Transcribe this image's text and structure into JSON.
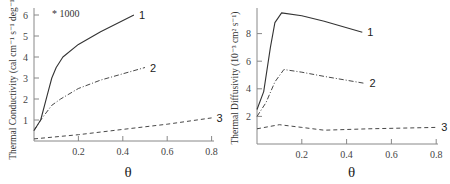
{
  "chart_data": [
    {
      "type": "line",
      "title": "",
      "xlabel": "θ",
      "ylabel": "Thermal Conductivity (cal cm⁻¹ s⁻¹ deg⁻¹)",
      "annotation": "* 1000",
      "xlim": [
        0,
        0.8
      ],
      "ylim": [
        0,
        6
      ],
      "xticks": [
        "0.2",
        "0.4",
        "0.6",
        "0.8"
      ],
      "yticks": [
        "1",
        "2",
        "3",
        "4",
        "5",
        "6"
      ],
      "grid": false,
      "series": [
        {
          "name": "1",
          "style": "solid",
          "x": [
            0,
            0.03,
            0.06,
            0.08,
            0.1,
            0.13,
            0.2,
            0.3,
            0.45
          ],
          "values": [
            0.5,
            1.0,
            2.2,
            3.0,
            3.5,
            4.0,
            4.6,
            5.2,
            6.0
          ]
        },
        {
          "name": "2",
          "style": "dashdot",
          "x": [
            0,
            0.03,
            0.08,
            0.12,
            0.2,
            0.3,
            0.4,
            0.5
          ],
          "values": [
            0.5,
            1.0,
            1.7,
            2.0,
            2.5,
            2.9,
            3.2,
            3.5
          ]
        },
        {
          "name": "3",
          "style": "dashed",
          "x": [
            0,
            0.2,
            0.4,
            0.6,
            0.8
          ],
          "values": [
            0.1,
            0.3,
            0.55,
            0.8,
            1.1
          ]
        }
      ]
    },
    {
      "type": "line",
      "title": "",
      "xlabel": "θ",
      "ylabel": "Thermal Diffusivity (10⁻³ cm² s⁻¹)",
      "xlim": [
        0,
        0.8
      ],
      "ylim": [
        0,
        10
      ],
      "xticks": [
        "0.2",
        "0.4",
        "0.6",
        "0.8"
      ],
      "yticks": [
        "2",
        "4",
        "6",
        "8"
      ],
      "grid": false,
      "series": [
        {
          "name": "1",
          "style": "solid",
          "x": [
            0,
            0.03,
            0.06,
            0.08,
            0.11,
            0.2,
            0.3,
            0.47
          ],
          "values": [
            2.5,
            3.8,
            7.0,
            8.8,
            9.5,
            9.3,
            8.9,
            8.1
          ]
        },
        {
          "name": "2",
          "style": "dashdot",
          "x": [
            0,
            0.04,
            0.08,
            0.12,
            0.2,
            0.3,
            0.48
          ],
          "values": [
            2.0,
            3.0,
            4.5,
            5.4,
            5.2,
            4.9,
            4.4
          ]
        },
        {
          "name": "3",
          "style": "dashed",
          "x": [
            0,
            0.1,
            0.2,
            0.3,
            0.5,
            0.8
          ],
          "values": [
            1.1,
            1.4,
            1.2,
            1.0,
            1.1,
            1.2
          ]
        }
      ]
    }
  ]
}
